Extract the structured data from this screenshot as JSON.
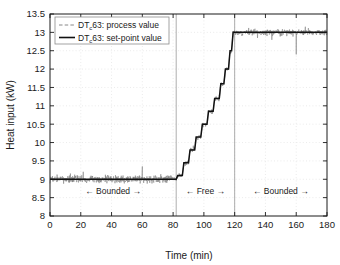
{
  "chart_data": {
    "type": "line",
    "title": "",
    "xlabel": "Time (min)",
    "ylabel": "Heat input (kW)",
    "xlim": [
      0,
      180
    ],
    "ylim": [
      8,
      13.5
    ],
    "xticks": [
      0,
      20,
      40,
      60,
      80,
      100,
      120,
      140,
      160,
      180
    ],
    "yticks": [
      8,
      8.5,
      9,
      9.5,
      10,
      10.5,
      11,
      11.5,
      12,
      12.5,
      13,
      13.5
    ],
    "xtick_labels": [
      "0",
      "20",
      "40",
      "60",
      "80",
      "100",
      "120",
      "140",
      "160",
      "180"
    ],
    "ytick_labels": [
      "8",
      "8.5",
      "9",
      "9.5",
      "10",
      "10.5",
      "11",
      "11.5",
      "12",
      "12.5",
      "13",
      "13.5"
    ],
    "grid": "dotted",
    "legend_position": "top-left",
    "legend": [
      {
        "label_prefix": "DT",
        "label_sub": "c",
        "label_suffix": "63: process value",
        "style": "dashed",
        "color": "#7a7a7a"
      },
      {
        "label_prefix": "DT",
        "label_sub": "c",
        "label_suffix": "63: set-point value",
        "style": "solid",
        "color": "#111111"
      }
    ],
    "series": [
      {
        "name": "DTc63: process value",
        "style": "dashed",
        "color": "#7a7a7a",
        "description": "noisy measured heat input tracking the set-point",
        "noise_amplitude_baseline": 0.16,
        "noise_amplitude_plateau": 0.13,
        "spikes": [
          {
            "x": 110,
            "y": 11.3
          },
          {
            "x": 160,
            "y": 12.4
          },
          {
            "x": 60,
            "y": 9.35
          }
        ]
      },
      {
        "name": "DTc63: set-point value",
        "style": "solid",
        "color": "#111111",
        "description": "staircase set-point: flat 9 kW, ramp to 13 kW, flat 13 kW",
        "points": [
          [
            0,
            9.0
          ],
          [
            82,
            9.0
          ],
          [
            83,
            9.1
          ],
          [
            86,
            9.1
          ],
          [
            87,
            9.45
          ],
          [
            90,
            9.45
          ],
          [
            91,
            9.8
          ],
          [
            94,
            9.8
          ],
          [
            95,
            10.15
          ],
          [
            98,
            10.15
          ],
          [
            99,
            10.5
          ],
          [
            102,
            10.5
          ],
          [
            103,
            10.85
          ],
          [
            106,
            10.85
          ],
          [
            107,
            11.2
          ],
          [
            110,
            11.2
          ],
          [
            111,
            11.6
          ],
          [
            113,
            11.6
          ],
          [
            114,
            12.0
          ],
          [
            116,
            12.0
          ],
          [
            117,
            12.5
          ],
          [
            118,
            12.5
          ],
          [
            119,
            13.0
          ],
          [
            180,
            13.0
          ]
        ]
      }
    ],
    "vlines": [
      {
        "x": 82,
        "color": "#999999"
      },
      {
        "x": 120,
        "color": "#999999"
      }
    ],
    "annotations": [
      {
        "text": "Bounded",
        "left_arrow": "←",
        "right_arrow": "→",
        "x_center": 41,
        "y": 8.6
      },
      {
        "text": "Free",
        "left_arrow": "←",
        "right_arrow": "→",
        "x_center": 101,
        "y": 8.6
      },
      {
        "text": "Bounded",
        "left_arrow": "←",
        "right_arrow": "→",
        "x_center": 150,
        "y": 8.6
      }
    ],
    "colors": {
      "axis": "#1a1a1a",
      "grid": "#e2e2e2",
      "setpoint": "#111111",
      "process": "#7a7a7a",
      "divider": "#999999",
      "background": "#ffffff"
    }
  }
}
